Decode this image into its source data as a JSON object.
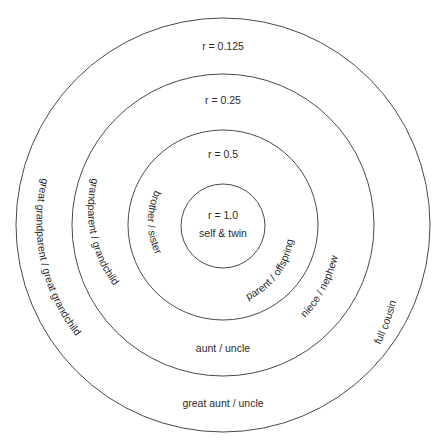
{
  "diagram": {
    "center": {
      "x": 223,
      "y": 225
    },
    "stroke_color": "#4a4a4a",
    "text_color": "#2a2a2a",
    "rings": [
      {
        "radius": 42,
        "coefficient_label": "r = 1.0",
        "relations": [
          "self & twin"
        ]
      },
      {
        "radius": 95,
        "coefficient_label": "r = 0.5",
        "relations": [
          "brother / sister",
          "parent / offspring"
        ]
      },
      {
        "radius": 151,
        "coefficient_label": "r = 0.25",
        "relations": [
          "grandparent / grandchild",
          "niece / nephew",
          "aunt / uncle"
        ]
      },
      {
        "radius": 207,
        "coefficient_label": "r = 0.125",
        "relations": [
          "great grandparent / great grandchild",
          "full cousin",
          "great aunt / uncle"
        ]
      }
    ]
  }
}
